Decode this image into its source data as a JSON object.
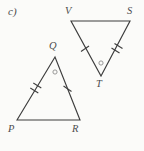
{
  "figure": {
    "part_label": "c)",
    "background_color": "#fbfbf9",
    "stroke_color": "#3d3d3d",
    "label_color": "#4d4d4d"
  },
  "triangles": [
    {
      "name": "PQR",
      "orientation": "apex-up",
      "vertices": [
        {
          "label": "P",
          "x": 17,
          "y": 120,
          "label_x": 8,
          "label_y": 124
        },
        {
          "label": "Q",
          "x": 55,
          "y": 57,
          "label_x": 49,
          "label_y": 41
        },
        {
          "label": "R",
          "x": 80,
          "y": 120,
          "label_x": 72,
          "label_y": 124
        }
      ],
      "sides": [
        {
          "from": "P",
          "to": "Q",
          "ticks": 2
        },
        {
          "from": "Q",
          "to": "R",
          "ticks": 1
        },
        {
          "from": "R",
          "to": "P",
          "ticks": 0
        }
      ],
      "angle_marks": [
        {
          "at": "Q",
          "x": 55,
          "y": 72,
          "style": "small-circle"
        }
      ]
    },
    {
      "name": "VST",
      "orientation": "apex-down",
      "vertices": [
        {
          "label": "V",
          "x": 71,
          "y": 21,
          "label_x": 65,
          "label_y": 6
        },
        {
          "label": "S",
          "x": 130,
          "y": 21,
          "label_x": 127,
          "label_y": 6
        },
        {
          "label": "T",
          "x": 101,
          "y": 76,
          "label_x": 96,
          "label_y": 79
        }
      ],
      "sides": [
        {
          "from": "V",
          "to": "T",
          "ticks": 1
        },
        {
          "from": "T",
          "to": "S",
          "ticks": 2
        },
        {
          "from": "S",
          "to": "V",
          "ticks": 0
        }
      ],
      "angle_marks": [
        {
          "at": "T",
          "x": 101,
          "y": 63,
          "style": "small-circle"
        }
      ]
    }
  ]
}
